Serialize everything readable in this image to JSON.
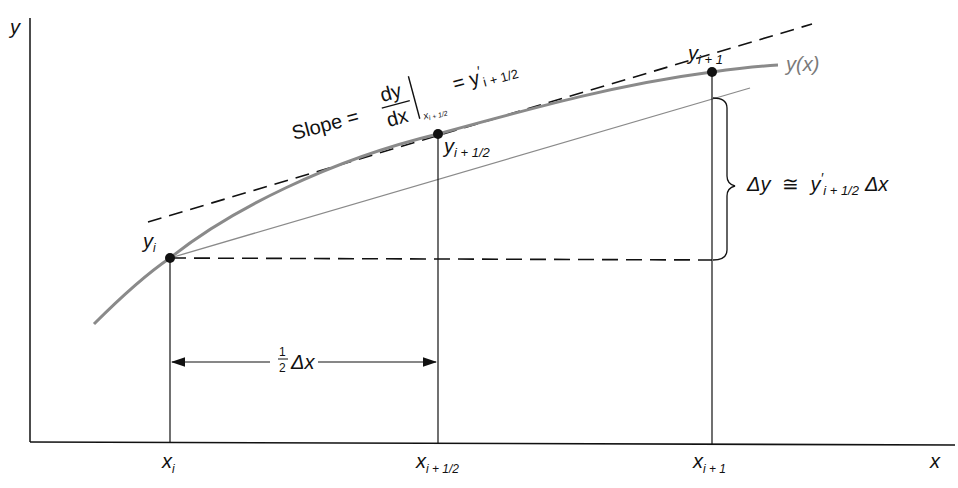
{
  "figure": {
    "axes": {
      "y_label": "y",
      "x_label": "x"
    },
    "curve_label": "y(x)",
    "points": {
      "y_i": {
        "base": "y",
        "sub": "i"
      },
      "y_mid": {
        "base": "y",
        "sub": "i + 1/2"
      },
      "y_next": {
        "base": "y",
        "sub": "i + 1"
      }
    },
    "x_ticks": [
      {
        "base": "x",
        "sub": "i"
      },
      {
        "base": "x",
        "sub": "i + 1/2"
      },
      {
        "base": "x",
        "sub": "i + 1"
      }
    ],
    "slope_annotation": {
      "prefix": "Slope =",
      "numerator": "dy",
      "denominator": "dx",
      "eval_sub": "x",
      "eval_sub_sub": "i + 1/2",
      "equals": "= y",
      "prime": "′",
      "result_sub": "i + 1/2"
    },
    "delta_y_annotation": {
      "lhs": "Δy",
      "approx": "≅",
      "rhs_base": "y",
      "rhs_prime": "′",
      "rhs_sub": "i + 1/2",
      "rhs_tail": "Δx"
    },
    "half_dx_annotation": {
      "num": "1",
      "den": "2",
      "tail": "Δx"
    },
    "colors": {
      "curve": "#8a8a8a",
      "axes": "#111111",
      "secant": "#8a8a8a",
      "dashes": "#111111"
    }
  }
}
